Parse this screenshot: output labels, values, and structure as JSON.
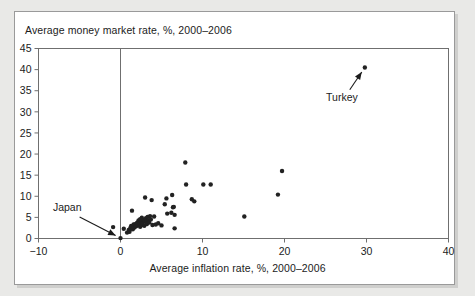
{
  "figure": {
    "background_color": "#e9e9e7",
    "panel_color": "#ffffff",
    "border_color": "#9a9a9a"
  },
  "chart_data": {
    "type": "scatter",
    "title": "",
    "subtitle": "",
    "xlabel": "Average inflation rate, %, 2000–2006",
    "ylabel": "Average money market rate, %, 2000–2006",
    "xlim": [
      -10,
      40
    ],
    "ylim": [
      0,
      45
    ],
    "xticks": [
      -10,
      0,
      10,
      20,
      30,
      40
    ],
    "xtick_labels": [
      "−10",
      "0",
      "10",
      "20",
      "30",
      "40"
    ],
    "yticks": [
      0,
      5,
      10,
      15,
      20,
      25,
      30,
      35,
      40,
      45
    ],
    "ytick_labels": [
      "0",
      "5",
      "10",
      "15",
      "20",
      "25",
      "30",
      "35",
      "40",
      "45"
    ],
    "grid": false,
    "legend": false,
    "marker_color": "#222222",
    "marker_size": 2.2,
    "axis_color": "#6f6f6f",
    "zero_line_x": 0,
    "points": [
      [
        -0.9,
        2.7
      ],
      [
        0.0,
        0.1
      ],
      [
        0.4,
        2.3
      ],
      [
        0.8,
        1.4
      ],
      [
        1.0,
        2.0
      ],
      [
        1.1,
        1.6
      ],
      [
        1.2,
        2.5
      ],
      [
        1.3,
        3.0
      ],
      [
        1.4,
        6.6
      ],
      [
        1.5,
        2.2
      ],
      [
        1.6,
        3.3
      ],
      [
        1.7,
        2.6
      ],
      [
        1.8,
        3.4
      ],
      [
        1.9,
        2.9
      ],
      [
        2.0,
        3.7
      ],
      [
        2.1,
        3.1
      ],
      [
        2.2,
        4.3
      ],
      [
        2.3,
        3.5
      ],
      [
        2.4,
        4.6
      ],
      [
        2.4,
        2.8
      ],
      [
        2.5,
        4.0
      ],
      [
        2.6,
        3.2
      ],
      [
        2.6,
        4.9
      ],
      [
        2.7,
        3.6
      ],
      [
        2.8,
        4.4
      ],
      [
        2.9,
        3.0
      ],
      [
        3.0,
        4.1
      ],
      [
        3.0,
        9.7
      ],
      [
        3.1,
        4.8
      ],
      [
        3.2,
        3.4
      ],
      [
        3.3,
        5.1
      ],
      [
        3.4,
        4.2
      ],
      [
        3.5,
        3.8
      ],
      [
        3.6,
        5.3
      ],
      [
        3.7,
        4.5
      ],
      [
        3.8,
        9.1
      ],
      [
        3.9,
        3.2
      ],
      [
        4.1,
        5.2
      ],
      [
        4.3,
        3.3
      ],
      [
        4.6,
        3.6
      ],
      [
        5.0,
        3.1
      ],
      [
        5.4,
        8.1
      ],
      [
        5.6,
        9.5
      ],
      [
        5.7,
        5.9
      ],
      [
        6.2,
        6.1
      ],
      [
        6.3,
        10.3
      ],
      [
        6.4,
        7.4
      ],
      [
        6.5,
        7.5
      ],
      [
        6.6,
        5.6
      ],
      [
        6.6,
        2.4
      ],
      [
        7.9,
        18.0
      ],
      [
        8.0,
        12.8
      ],
      [
        8.7,
        9.3
      ],
      [
        9.0,
        8.8
      ],
      [
        10.1,
        12.8
      ],
      [
        11.0,
        12.8
      ],
      [
        15.1,
        5.2
      ],
      [
        19.2,
        10.4
      ],
      [
        19.7,
        16.0
      ],
      [
        29.8,
        40.5
      ]
    ],
    "annotations": [
      {
        "label": "Japan",
        "label_x": -6.5,
        "label_y": 6.6,
        "point_x": 0.0,
        "point_y": 0.1
      },
      {
        "label": "Turkey",
        "label_x": 27.0,
        "label_y": 32.5,
        "point_x": 29.8,
        "point_y": 40.5
      }
    ]
  }
}
